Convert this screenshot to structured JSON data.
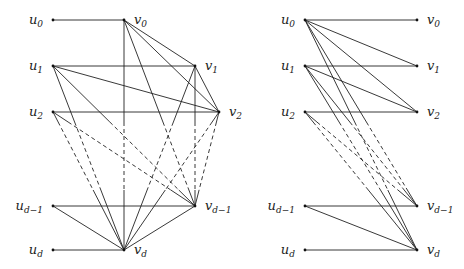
{
  "graphs": [
    {
      "id": "left",
      "name": "left-graph",
      "nodes": [
        {
          "id": "u0",
          "base": "u",
          "sub": "0"
        },
        {
          "id": "u1",
          "base": "u",
          "sub": "1"
        },
        {
          "id": "u2",
          "base": "u",
          "sub": "2"
        },
        {
          "id": "ud1",
          "base": "u",
          "sub": "d−1"
        },
        {
          "id": "ud",
          "base": "u",
          "sub": "d"
        },
        {
          "id": "v0",
          "base": "v",
          "sub": "0"
        },
        {
          "id": "v1",
          "base": "v",
          "sub": "1"
        },
        {
          "id": "v2",
          "base": "v",
          "sub": "2"
        },
        {
          "id": "vd1",
          "base": "v",
          "sub": "d−1"
        },
        {
          "id": "vd",
          "base": "v",
          "sub": "d"
        }
      ],
      "edges": [
        [
          "u0",
          "v0"
        ],
        [
          "u1",
          "v1"
        ],
        [
          "u1",
          "v2"
        ],
        [
          "u1",
          "vd1"
        ],
        [
          "u1",
          "vd"
        ],
        [
          "u2",
          "v2"
        ],
        [
          "u2",
          "vd1"
        ],
        [
          "u2",
          "vd"
        ],
        [
          "ud1",
          "vd1"
        ],
        [
          "ud1",
          "vd"
        ],
        [
          "ud",
          "vd"
        ],
        [
          "v0",
          "v1"
        ],
        [
          "v0",
          "v2"
        ],
        [
          "v0",
          "vd1"
        ],
        [
          "v0",
          "vd"
        ],
        [
          "v1",
          "v2"
        ],
        [
          "v1",
          "vd1"
        ],
        [
          "v1",
          "vd"
        ],
        [
          "v2",
          "vd1"
        ],
        [
          "v2",
          "vd"
        ],
        [
          "vd1",
          "vd"
        ]
      ]
    },
    {
      "id": "right",
      "name": "right-graph",
      "nodes": [
        {
          "id": "u0",
          "base": "u",
          "sub": "0"
        },
        {
          "id": "u1",
          "base": "u",
          "sub": "1"
        },
        {
          "id": "u2",
          "base": "u",
          "sub": "2"
        },
        {
          "id": "ud1",
          "base": "u",
          "sub": "d−1"
        },
        {
          "id": "ud",
          "base": "u",
          "sub": "d"
        },
        {
          "id": "v0",
          "base": "v",
          "sub": "0"
        },
        {
          "id": "v1",
          "base": "v",
          "sub": "1"
        },
        {
          "id": "v2",
          "base": "v",
          "sub": "2"
        },
        {
          "id": "vd1",
          "base": "v",
          "sub": "d−1"
        },
        {
          "id": "vd",
          "base": "v",
          "sub": "d"
        }
      ],
      "edges": [
        [
          "u0",
          "v0"
        ],
        [
          "u0",
          "v1"
        ],
        [
          "u0",
          "v2"
        ],
        [
          "u0",
          "vd1"
        ],
        [
          "u0",
          "vd"
        ],
        [
          "u1",
          "v1"
        ],
        [
          "u1",
          "v2"
        ],
        [
          "u1",
          "vd1"
        ],
        [
          "u1",
          "vd"
        ],
        [
          "u2",
          "v2"
        ],
        [
          "u2",
          "vd1"
        ],
        [
          "u2",
          "vd"
        ],
        [
          "ud1",
          "vd1"
        ],
        [
          "ud1",
          "vd"
        ],
        [
          "ud",
          "vd"
        ]
      ]
    }
  ]
}
